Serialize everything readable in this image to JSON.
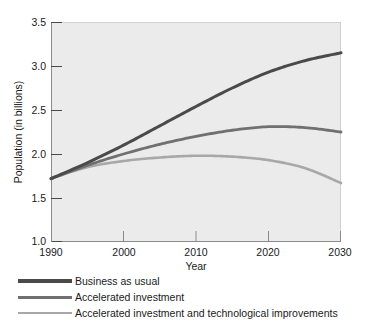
{
  "chart_data": {
    "type": "line",
    "title": "",
    "xlabel": "Year",
    "ylabel": "Population (in billions)",
    "xlim": [
      1990,
      2030
    ],
    "ylim": [
      1.0,
      3.5
    ],
    "xticks": [
      1990,
      2000,
      2010,
      2020,
      2030
    ],
    "xtick_labels": [
      "1990",
      "2000",
      "2010",
      "2020",
      "2030"
    ],
    "yticks": [
      1.0,
      1.5,
      2.0,
      2.5,
      3.0,
      3.5
    ],
    "ytick_labels": [
      "1.0",
      "1.5",
      "2.0",
      "2.5",
      "3.0",
      "3.5"
    ],
    "grid": false,
    "legend_position": "below",
    "plot_background": "#ebebeb",
    "figure_background": "#ffffff",
    "x": [
      1990,
      1995,
      2000,
      2005,
      2010,
      2015,
      2020,
      2025,
      2030
    ],
    "series": [
      {
        "name": "Business as usual",
        "color": "#4a4a4a",
        "values": [
          1.72,
          1.9,
          2.1,
          2.32,
          2.54,
          2.75,
          2.93,
          3.06,
          3.15
        ]
      },
      {
        "name": "Accelerated investment",
        "color": "#707070",
        "values": [
          1.72,
          1.87,
          2.0,
          2.11,
          2.2,
          2.27,
          2.31,
          2.3,
          2.25
        ]
      },
      {
        "name": "Accelerated investment and technological improvements",
        "color": "#a8a8a8",
        "values": [
          1.72,
          1.85,
          1.92,
          1.96,
          1.98,
          1.97,
          1.93,
          1.84,
          1.67
        ]
      }
    ]
  },
  "legend": {
    "items": [
      {
        "label": "Business as usual"
      },
      {
        "label": "Accelerated investment"
      },
      {
        "label": "Accelerated investment and technological improvements"
      }
    ]
  },
  "axes": {
    "x_title": "Year",
    "y_title": "Population (in billions)"
  }
}
